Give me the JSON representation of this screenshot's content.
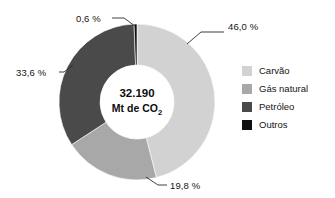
{
  "chart_data": {
    "type": "pie",
    "variant": "donut",
    "title": "",
    "subtitle": "",
    "xlabel": "",
    "ylabel": "",
    "grid": false,
    "legend_position": "right",
    "center_value": "32.190",
    "center_unit": "Mt de CO",
    "center_unit_subscript": "2",
    "start_angle_deg": 0,
    "direction": "clockwise",
    "categories": [
      "Carvão",
      "Gás natural",
      "Petróleo",
      "Outros"
    ],
    "values": [
      46.0,
      19.8,
      33.6,
      0.6
    ],
    "value_labels": [
      "46,0 %",
      "19,8 %",
      "33,6 %",
      "0,6 %"
    ],
    "colors": [
      "#d2d2d2",
      "#a8a8a8",
      "#4a4a4a",
      "#111111"
    ],
    "series": [
      {
        "name": "Emissões de CO2 por combustível",
        "values": [
          46.0,
          19.8,
          33.6,
          0.6
        ]
      }
    ],
    "slices": [
      {
        "label": "Carvão",
        "value": 46.0,
        "value_label": "46,0 %",
        "color": "#d2d2d2",
        "callout_x": 228,
        "callout_y": 30,
        "anchor": "start",
        "leader": "187,44 L 201,32 L 224,32"
      },
      {
        "label": "Gás natural",
        "value": 19.8,
        "value_label": "19,8 %",
        "color": "#a8a8a8",
        "callout_x": 170,
        "callout_y": 189,
        "anchor": "start",
        "leader": "146,177 L 158,185 L 167,185"
      },
      {
        "label": "Petróleo",
        "value": 33.6,
        "value_label": "33,6 %",
        "color": "#4a4a4a",
        "callout_x": 16,
        "callout_y": 76,
        "anchor": "start",
        "leader": "73,65 L 64,72 L 59,72"
      },
      {
        "label": "Outros",
        "value": 0.6,
        "value_label": "0,6 %",
        "color": "#111111",
        "callout_x": 76,
        "callout_y": 22,
        "anchor": "start",
        "leader": "135,26 L 124,18 L 112,18"
      }
    ]
  },
  "legend": {
    "items": [
      {
        "label": "Carvão",
        "color": "#d2d2d2"
      },
      {
        "label": "Gás natural",
        "color": "#a8a8a8"
      },
      {
        "label": "Petróleo",
        "color": "#4a4a4a"
      },
      {
        "label": "Outros",
        "color": "#111111"
      }
    ]
  },
  "geometry": {
    "cx": 137,
    "cy": 102,
    "outer_radius": 78,
    "inner_radius": 37
  }
}
